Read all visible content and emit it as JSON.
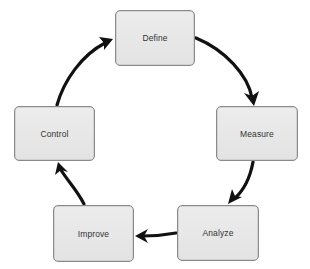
{
  "diagram": {
    "type": "cycle",
    "nodes": [
      {
        "id": "define",
        "label": "Define",
        "x": 115,
        "y": 10,
        "w": 80,
        "h": 56
      },
      {
        "id": "measure",
        "label": "Measure",
        "x": 216,
        "y": 106,
        "w": 82,
        "h": 55
      },
      {
        "id": "analyze",
        "label": "Analyze",
        "x": 177,
        "y": 205,
        "w": 82,
        "h": 56
      },
      {
        "id": "improve",
        "label": "Improve",
        "x": 53,
        "y": 205,
        "w": 81,
        "h": 57
      },
      {
        "id": "control",
        "label": "Control",
        "x": 14,
        "y": 106,
        "w": 81,
        "h": 55
      }
    ],
    "edges": [
      {
        "from": "define",
        "to": "measure"
      },
      {
        "from": "measure",
        "to": "analyze"
      },
      {
        "from": "analyze",
        "to": "improve"
      },
      {
        "from": "improve",
        "to": "control"
      },
      {
        "from": "control",
        "to": "define"
      }
    ],
    "colors": {
      "node_fill": "#e8e8e8",
      "node_border": "#8a8a8a",
      "label": "#333333",
      "arrow": "#111111",
      "background": "#ffffff"
    }
  }
}
